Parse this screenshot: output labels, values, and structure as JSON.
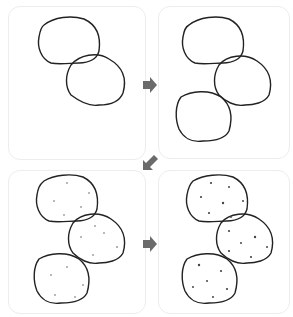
{
  "diagram": {
    "type": "step-sequence",
    "steps": [
      {
        "index": 1,
        "description": "Two rounded blob shapes (outlines)"
      },
      {
        "index": 2,
        "description": "Three rounded blob shapes (outlines)"
      },
      {
        "index": 3,
        "description": "Three blob shapes with light speckles"
      },
      {
        "index": 4,
        "description": "Three blob shapes with darker speckles"
      }
    ],
    "arrows": [
      {
        "from": 1,
        "to": 2,
        "direction": "right"
      },
      {
        "from": 2,
        "to": 3,
        "direction": "down-left"
      },
      {
        "from": 3,
        "to": 4,
        "direction": "right"
      }
    ],
    "colors": {
      "outline": "#222222",
      "arrow": "#6b6b6b",
      "panel_border": "#ededed"
    }
  }
}
